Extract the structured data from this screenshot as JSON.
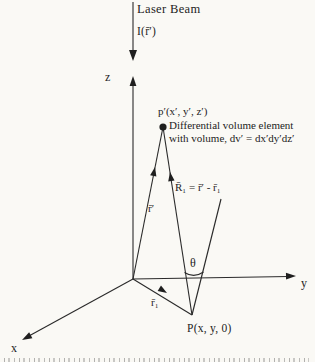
{
  "figure": {
    "background_color": "#faf9f5",
    "ink_color": "#2a2a2a",
    "labels": {
      "laser_beam": "Laser Beam",
      "laser_intensity": "I(r̄′)",
      "z_axis": "z",
      "y_axis": "y",
      "x_axis": "x",
      "point_p_prime": "p′(x′, y′, z′)",
      "volume_note_line1": "Differential volume element",
      "volume_note_line2": "with volume, dv′ = dx′dy′dz′",
      "vector_R1_equation": "R̄₁ = r̄′ - r̄₁",
      "vector_r_prime": "r̄′",
      "scattering_angle": "θ",
      "vector_r1": "r̄₁",
      "point_P": "P(x, y, 0)"
    }
  }
}
